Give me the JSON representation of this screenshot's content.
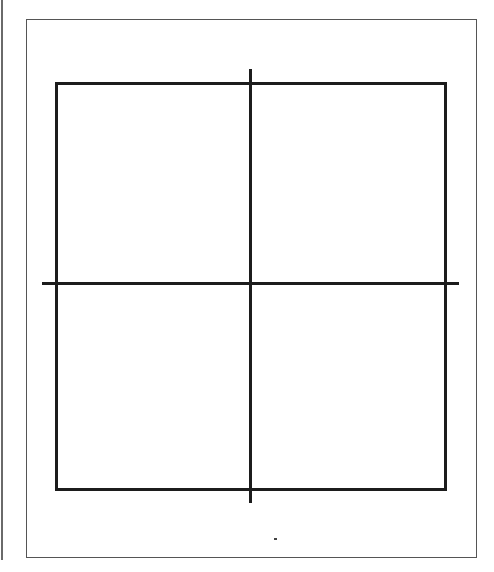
{
  "diagram": {
    "type": "quadrant-grid",
    "quadrants": [
      {
        "position": "top-left",
        "label": ""
      },
      {
        "position": "top-right",
        "label": ""
      },
      {
        "position": "bottom-left",
        "label": ""
      },
      {
        "position": "bottom-right",
        "label": ""
      }
    ],
    "colors": {
      "stroke": "#1c1c1c",
      "frame": "#555555",
      "background": "#ffffff"
    }
  }
}
